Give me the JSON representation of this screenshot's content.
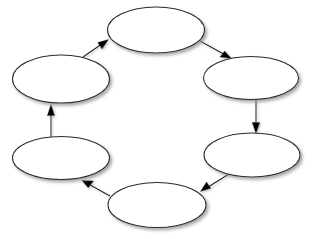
{
  "diagram": {
    "type": "cycle",
    "direction": "clockwise",
    "node_count": 6,
    "edge_count": 6,
    "background_color": "#ffffff",
    "node_fill_color": "#ffffff",
    "node_stroke_color": "#2b2b2b",
    "edge_color": "#1e1e1e",
    "shadow_color": "#9a9a9a",
    "nodes": [
      {
        "id": "node-top",
        "label": "",
        "cx": 156,
        "cy": 30,
        "rx": 48.5,
        "ry": 23.0
      },
      {
        "id": "node-top-right",
        "label": "",
        "cx": 251,
        "cy": 78,
        "rx": 47.5,
        "ry": 21.5
      },
      {
        "id": "node-bottom-right",
        "label": "",
        "cx": 252,
        "cy": 155,
        "rx": 48.0,
        "ry": 22.0
      },
      {
        "id": "node-bottom",
        "label": "",
        "cx": 157,
        "cy": 205,
        "rx": 49.0,
        "ry": 22.5
      },
      {
        "id": "node-bottom-left",
        "label": "",
        "cx": 61,
        "cy": 158,
        "rx": 48.5,
        "ry": 21.5
      },
      {
        "id": "node-top-left",
        "label": "",
        "cx": 61,
        "cy": 79,
        "rx": 48.5,
        "ry": 24.0
      }
    ],
    "edges": [
      {
        "id": "edge-top-to-top-right",
        "from": "node-top",
        "to": "node-top-right",
        "label": "",
        "x1": 200,
        "y1": 41,
        "x2": 229,
        "y2": 57,
        "orientation": "diagonal-down-right"
      },
      {
        "id": "edge-top-right-to-bottom-right",
        "from": "node-top-right",
        "to": "node-bottom-right",
        "label": "",
        "x1": 256,
        "y1": 100,
        "x2": 256,
        "y2": 131,
        "orientation": "vertical-down"
      },
      {
        "id": "edge-bottom-right-to-bottom",
        "from": "node-bottom-right",
        "to": "node-bottom",
        "label": "",
        "x1": 229,
        "y1": 174,
        "x2": 203,
        "y2": 191,
        "orientation": "diagonal-down-left"
      },
      {
        "id": "edge-bottom-to-bottom-left",
        "from": "node-bottom",
        "to": "node-bottom-left",
        "label": "",
        "x1": 110,
        "y1": 196,
        "x2": 83,
        "y2": 181,
        "orientation": "diagonal-up-left"
      },
      {
        "id": "edge-bottom-left-to-top-left",
        "from": "node-bottom-left",
        "to": "node-top-left",
        "label": "",
        "x1": 51,
        "y1": 137,
        "x2": 51,
        "y2": 106,
        "orientation": "vertical-up"
      },
      {
        "id": "edge-top-left-to-top",
        "from": "node-top-left",
        "to": "node-top",
        "label": "",
        "x1": 83,
        "y1": 57,
        "x2": 106,
        "y2": 40,
        "orientation": "diagonal-up-right"
      }
    ]
  }
}
